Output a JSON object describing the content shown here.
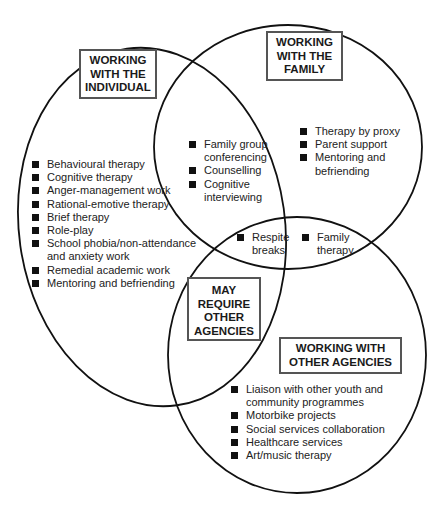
{
  "diagram": {
    "type": "venn",
    "circles": {
      "individual": {
        "title_lines": [
          "WORKING",
          "WITH THE",
          "INDIVIDUAL"
        ],
        "items": [
          "Behavioural therapy",
          "Cognitive therapy",
          "Anger-management work",
          "Rational-emotive therapy",
          "Brief therapy",
          "Role-play",
          "School phobia/non-attendance\nand anxiety work",
          "Remedial academic work",
          "Mentoring and befriending"
        ]
      },
      "family": {
        "title_lines": [
          "WORKING",
          "WITH THE",
          "FAMILY"
        ],
        "items": [
          "Therapy by proxy",
          "Parent support",
          "Mentoring and\nbefriending"
        ]
      },
      "agencies": {
        "title_lines": [
          "WORKING WITH",
          "OTHER AGENCIES"
        ],
        "items": [
          "Liaison with other youth and\ncommunity programmes",
          "Motorbike projects",
          "Social services collaboration",
          "Healthcare services",
          "Art/music therapy"
        ]
      }
    },
    "overlaps": {
      "individual_family": [
        "Family group\nconferencing",
        "Counselling",
        "Cognitive\ninterviewing"
      ],
      "all_three": [
        "Respite\nbreaks"
      ],
      "family_agencies": [
        "Family\ntherapy"
      ],
      "individual_agencies_title_lines": [
        "MAY",
        "REQUIRE",
        "OTHER",
        "AGENCIES"
      ]
    },
    "colors": {
      "stroke": "#111111",
      "box_border": "#555555",
      "text": "#1a1a1a",
      "background": "#ffffff"
    }
  }
}
